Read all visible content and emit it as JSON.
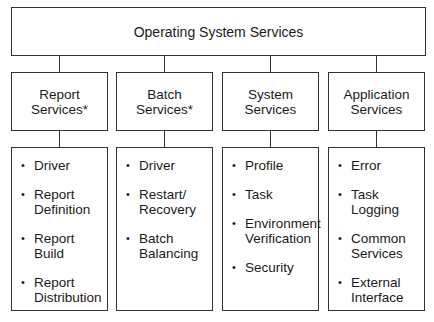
{
  "root": {
    "label": "Operating System Services"
  },
  "columns": [
    {
      "header": "Report\nServices*",
      "items": [
        "Driver",
        "Report\nDefinition",
        "Report\nBuild",
        "Report\nDistribution"
      ]
    },
    {
      "header": "Batch\nServices*",
      "items": [
        "Driver",
        "Restart/\nRecovery",
        "Batch\nBalancing"
      ]
    },
    {
      "header": "System\nServices",
      "items": [
        "Profile",
        "Task",
        "Environment\nVerification",
        "Security"
      ]
    },
    {
      "header": "Application\nServices",
      "items": [
        "Error",
        "Task\nLogging",
        "Common\nServices",
        "External\nInterface"
      ]
    }
  ]
}
